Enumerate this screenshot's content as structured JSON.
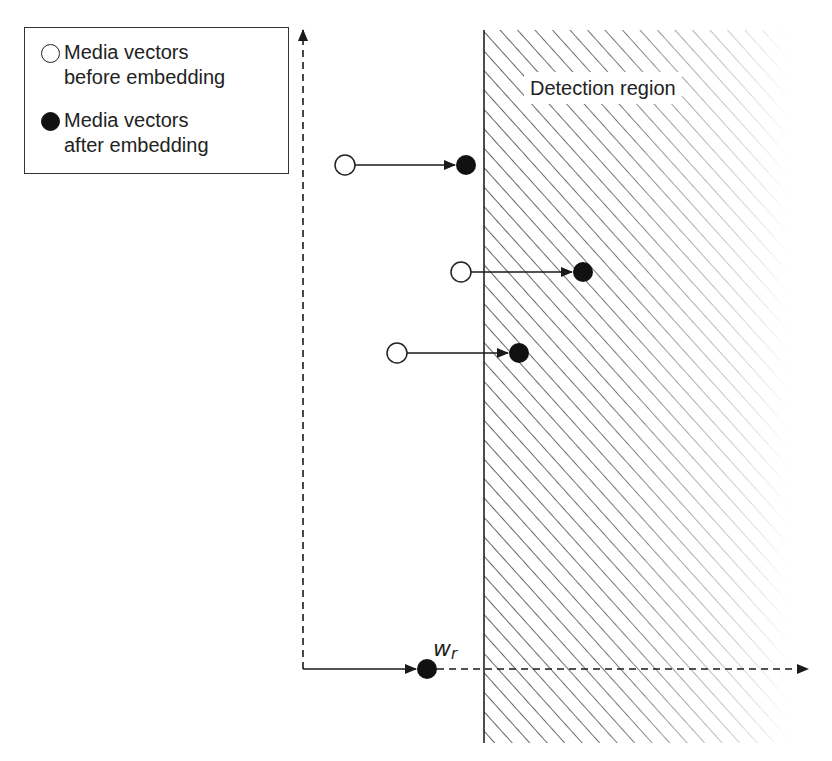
{
  "legend": {
    "before": {
      "icon": "open-circle-icon",
      "line1": "Media vectors",
      "line2": "before embedding"
    },
    "after": {
      "icon": "filled-circle-icon",
      "line1": "Media vectors",
      "line2": "after embedding"
    }
  },
  "region": {
    "label": "Detection region",
    "boundary_x": 484,
    "top_y": 30,
    "bottom_y": 743,
    "fade_end_x": 790,
    "hatch_color": "#3a3a3a"
  },
  "axes": {
    "origin": [
      303,
      669
    ],
    "y_top": 28,
    "x_right": 808,
    "color": "#1a1a1a"
  },
  "reference": {
    "label_main": "w",
    "label_sub": "r",
    "point": [
      427,
      669
    ]
  },
  "vectors": [
    {
      "before": [
        345,
        165
      ],
      "after": [
        466,
        165
      ]
    },
    {
      "before": [
        461,
        272
      ],
      "after": [
        583,
        272
      ]
    },
    {
      "before": [
        397,
        353
      ],
      "after": [
        519,
        353
      ]
    }
  ],
  "colors": {
    "stroke": "#1a1a1a",
    "fill_open": "#ffffff",
    "fill_closed": "#111111"
  }
}
